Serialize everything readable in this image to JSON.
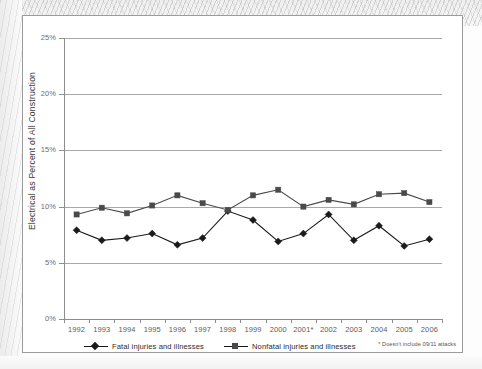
{
  "figure": {
    "footnote": "* Doesn't include 09/11 attacks"
  },
  "legend": {
    "items": [
      {
        "label": "Fatal injuries and illnesses",
        "marker": "diamond-marker",
        "color": "#1a1a1a"
      },
      {
        "label": "Nonfatal injuries and illnesses",
        "marker": "square-marker",
        "color": "#4a4a4a"
      }
    ]
  },
  "chart_data": {
    "type": "line",
    "title": "",
    "xlabel": "",
    "ylabel": "Electrical as Percent of All Construction",
    "ylim": [
      0,
      25
    ],
    "ytick_labels": [
      "25%",
      "20%",
      "15%",
      "10%",
      "5%",
      "0%"
    ],
    "ytick_values": [
      25,
      20,
      15,
      10,
      5,
      0
    ],
    "grid": true,
    "legend_position": "bottom-left",
    "categories": [
      "1992",
      "1993",
      "1994",
      "1995",
      "1996",
      "1997",
      "1998",
      "1999",
      "2000",
      "2001*",
      "2002",
      "2003",
      "2004",
      "2005",
      "2006"
    ],
    "x": [
      1992,
      1993,
      1994,
      1995,
      1996,
      1997,
      1998,
      1999,
      2000,
      2001,
      2002,
      2003,
      2004,
      2005,
      2006
    ],
    "series": [
      {
        "name": "Fatal injuries and illnesses",
        "color": "#1a1a1a",
        "marker": "diamond",
        "values": [
          7.9,
          7.0,
          7.2,
          7.6,
          6.6,
          7.2,
          9.6,
          8.8,
          6.9,
          7.6,
          9.3,
          7.0,
          8.3,
          6.5,
          7.1
        ]
      },
      {
        "name": "Nonfatal injuries and illnesses",
        "color": "#4a4a4a",
        "marker": "square",
        "values": [
          9.3,
          9.9,
          9.4,
          10.1,
          11.0,
          10.3,
          9.7,
          11.0,
          11.5,
          10.0,
          10.6,
          10.2,
          11.1,
          11.2,
          10.4
        ]
      }
    ]
  }
}
